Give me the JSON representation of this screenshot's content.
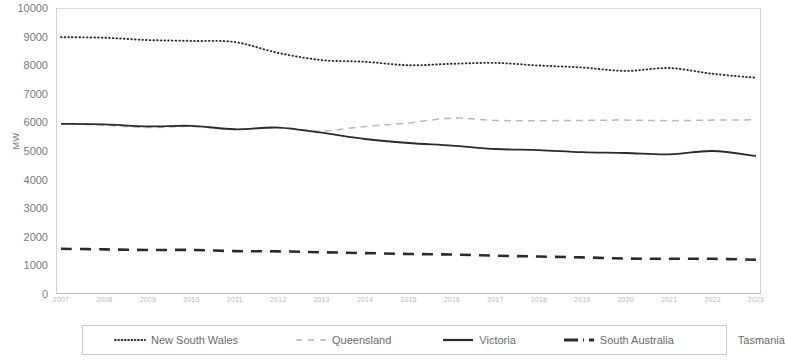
{
  "chart_data": {
    "type": "line",
    "title": "",
    "xlabel": "",
    "ylabel": "MW",
    "ylim": [
      0,
      10000
    ],
    "ytick_step": 1000,
    "yticks": [
      "0",
      "1000",
      "2000",
      "3000",
      "4000",
      "5000",
      "6000",
      "7000",
      "8000",
      "9000",
      "10000"
    ],
    "grid": false,
    "legend_position": "bottom",
    "x": [
      "2007",
      "2008",
      "2009",
      "2010",
      "2011",
      "2012",
      "2013",
      "2014",
      "2015",
      "2016",
      "2017",
      "2018",
      "2019",
      "2020",
      "2021",
      "2022",
      "2023"
    ],
    "categories": [
      "2007",
      "2008",
      "2009",
      "2010",
      "2011",
      "2012",
      "2013",
      "2014",
      "2015",
      "2016",
      "2017",
      "2018",
      "2019",
      "2020",
      "2021",
      "2022",
      "2023"
    ],
    "series": [
      {
        "name": "New South Wales",
        "style": "dotted",
        "color": "#2b2b2b",
        "values": [
          8980,
          8960,
          8880,
          8850,
          8810,
          8430,
          8180,
          8120,
          8000,
          8050,
          8080,
          7990,
          7920,
          7800,
          7900,
          7700,
          7560
        ]
      },
      {
        "name": "Queensland",
        "style": "dashed",
        "color": "#b9b9b9",
        "values": [
          5960,
          5900,
          5820,
          5860,
          5760,
          5820,
          5700,
          5860,
          5980,
          6150,
          6070,
          6060,
          6070,
          6080,
          6060,
          6080,
          6090
        ]
      },
      {
        "name": "Victoria",
        "style": "solid",
        "color": "#2b2b2b",
        "values": [
          5950,
          5930,
          5860,
          5880,
          5760,
          5820,
          5640,
          5420,
          5280,
          5190,
          5070,
          5030,
          4960,
          4930,
          4880,
          5000,
          4820
        ]
      },
      {
        "name": "South Australia",
        "style": "dashdot",
        "color": "#2b2b2b",
        "values": [
          1580,
          1560,
          1540,
          1540,
          1500,
          1490,
          1460,
          1430,
          1400,
          1380,
          1340,
          1310,
          1280,
          1240,
          1230,
          1230,
          1200
        ]
      },
      {
        "name": "Tasmania",
        "style": "solid-light",
        "color": "#d8d8d8",
        "values": [
          0,
          0,
          0,
          0,
          0,
          0,
          0,
          0,
          0,
          0,
          0,
          0,
          0,
          0,
          0,
          0,
          0
        ]
      }
    ]
  },
  "axis": {
    "y_title": "MW"
  },
  "legend": {
    "items": [
      {
        "label": "New South Wales",
        "icon": "dotted-line-icon"
      },
      {
        "label": "Queensland",
        "icon": "dashed-line-icon"
      },
      {
        "label": "Victoria",
        "icon": "solid-line-icon"
      },
      {
        "label": "South Australia",
        "icon": "dashdot-line-icon"
      },
      {
        "label": "Tasmania",
        "icon": "faint-line-icon"
      }
    ]
  }
}
